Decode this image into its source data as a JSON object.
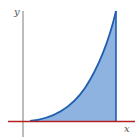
{
  "figure": {
    "axes": {
      "x_label": "x",
      "y_label": "y"
    },
    "colors": {
      "fill": "#8fb3e0",
      "curve": "#1f5fb0",
      "x_axis": "#b22222",
      "y_axis": "#6b6b6b",
      "label": "#555555"
    },
    "shape": {
      "curve_type": "power (y = k·x^n, concave up)",
      "left_bound": "y-axis region (curve starts near x-axis)",
      "right_bound": "vertical line at right edge"
    }
  }
}
